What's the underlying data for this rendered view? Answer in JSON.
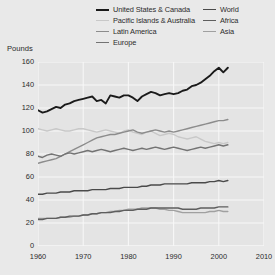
{
  "axis": {
    "ylabel": "Pounds",
    "yticks": [
      "0",
      "20",
      "40",
      "60",
      "80",
      "100",
      "120",
      "140",
      "160"
    ],
    "xticks": [
      "1960",
      "1970",
      "1980",
      "1990",
      "2000",
      "2010"
    ]
  },
  "legend": {
    "left_column": [
      {
        "label": "United States & Canada",
        "color": "#1a1a1a"
      },
      {
        "label": "Pacific Islands & Australia",
        "color": "#c8c8c8"
      },
      {
        "label": "Latin America",
        "color": "#8c8c8c"
      },
      {
        "label": "Europe",
        "color": "#737373"
      }
    ],
    "right_column": [
      {
        "label": "World",
        "color": "#4a4a4a"
      },
      {
        "label": "Africa",
        "color": "#5e5e5e"
      },
      {
        "label": "Asia",
        "color": "#a0a0a0"
      }
    ]
  },
  "chart_data": {
    "type": "line",
    "title": "",
    "xlabel": "",
    "ylabel": "Pounds",
    "xlim": [
      1960,
      2010
    ],
    "ylim": [
      0,
      160
    ],
    "grid": true,
    "legend_position": "top",
    "x": [
      1960,
      1961,
      1962,
      1963,
      1964,
      1965,
      1966,
      1967,
      1968,
      1969,
      1970,
      1971,
      1972,
      1973,
      1974,
      1975,
      1976,
      1977,
      1978,
      1979,
      1980,
      1981,
      1982,
      1983,
      1984,
      1985,
      1986,
      1987,
      1988,
      1989,
      1990,
      1991,
      1992,
      1993,
      1994,
      1995,
      1996,
      1997,
      1998,
      1999,
      2000,
      2001,
      2002
    ],
    "series": [
      {
        "name": "United States & Canada",
        "color": "#1a1a1a",
        "values": [
          118,
          116,
          117,
          119,
          121,
          120,
          123,
          124,
          126,
          127,
          128,
          129,
          130,
          126,
          127,
          124,
          131,
          130,
          129,
          131,
          131,
          129,
          126,
          130,
          132,
          134,
          133,
          131,
          132,
          133,
          132,
          133,
          135,
          136,
          139,
          140,
          142,
          145,
          148,
          152,
          155,
          151,
          155
        ]
      },
      {
        "name": "Pacific Islands & Australia",
        "color": "#c8c8c8",
        "values": [
          102,
          101,
          100,
          101,
          102,
          101,
          100,
          100,
          101,
          102,
          102,
          101,
          100,
          99,
          100,
          101,
          100,
          99,
          98,
          100,
          101,
          99,
          98,
          97,
          99,
          100,
          98,
          96,
          97,
          98,
          97,
          95,
          94,
          93,
          94,
          95,
          93,
          91,
          90,
          89,
          90,
          89,
          90
        ]
      },
      {
        "name": "Latin America",
        "color": "#8c8c8c",
        "values": [
          72,
          73,
          74,
          75,
          76,
          78,
          80,
          82,
          84,
          86,
          88,
          90,
          92,
          94,
          95,
          96,
          97,
          97,
          98,
          99,
          100,
          101,
          99,
          98,
          99,
          100,
          101,
          100,
          99,
          100,
          99,
          100,
          101,
          102,
          103,
          104,
          105,
          106,
          107,
          108,
          109,
          109,
          110
        ]
      },
      {
        "name": "Europe",
        "color": "#737373",
        "values": [
          78,
          77,
          79,
          80,
          79,
          78,
          80,
          81,
          80,
          81,
          82,
          83,
          82,
          83,
          84,
          83,
          82,
          83,
          84,
          85,
          84,
          83,
          84,
          85,
          84,
          85,
          86,
          85,
          84,
          85,
          86,
          85,
          84,
          83,
          84,
          85,
          86,
          85,
          86,
          87,
          88,
          87,
          88
        ]
      },
      {
        "name": "World",
        "color": "#4a4a4a",
        "values": [
          45,
          45,
          46,
          46,
          46,
          47,
          47,
          47,
          48,
          48,
          48,
          48,
          49,
          49,
          49,
          49,
          50,
          50,
          50,
          51,
          51,
          51,
          51,
          52,
          52,
          53,
          53,
          53,
          54,
          54,
          54,
          54,
          54,
          54,
          55,
          55,
          55,
          55,
          56,
          56,
          57,
          56,
          57
        ]
      },
      {
        "name": "Africa",
        "color": "#5e5e5e",
        "values": [
          23,
          23,
          24,
          24,
          24,
          25,
          25,
          26,
          26,
          26,
          27,
          27,
          28,
          28,
          29,
          29,
          29,
          30,
          30,
          31,
          31,
          31,
          32,
          32,
          32,
          33,
          33,
          33,
          33,
          33,
          33,
          33,
          32,
          32,
          32,
          32,
          33,
          33,
          33,
          33,
          34,
          34,
          34
        ]
      },
      {
        "name": "Asia",
        "color": "#a0a0a0",
        "values": [
          24,
          24,
          24,
          24,
          24,
          25,
          25,
          25,
          26,
          26,
          27,
          27,
          28,
          28,
          29,
          29,
          30,
          30,
          31,
          31,
          32,
          32,
          32,
          33,
          33,
          33,
          33,
          32,
          32,
          31,
          31,
          30,
          29,
          29,
          29,
          29,
          29,
          29,
          30,
          30,
          31,
          30,
          30
        ]
      }
    ]
  }
}
